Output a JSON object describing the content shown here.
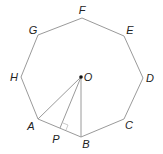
{
  "diagram": {
    "colors": {
      "line": "#9a9a9a",
      "text": "#222222",
      "point": "#111111"
    },
    "vertices": [
      {
        "name": "F",
        "x": 82,
        "y": 18,
        "lx": 82,
        "ly": 14
      },
      {
        "name": "E",
        "x": 124,
        "y": 36,
        "lx": 130,
        "ly": 34
      },
      {
        "name": "D",
        "x": 143,
        "y": 78,
        "lx": 150,
        "ly": 82
      },
      {
        "name": "C",
        "x": 124,
        "y": 119,
        "lx": 129,
        "ly": 129
      },
      {
        "name": "B",
        "x": 81,
        "y": 137,
        "lx": 86,
        "ly": 148
      },
      {
        "name": "A",
        "x": 38,
        "y": 119,
        "lx": 31,
        "ly": 130
      },
      {
        "name": "H",
        "x": 21,
        "y": 77,
        "lx": 14,
        "ly": 81
      },
      {
        "name": "G",
        "x": 38,
        "y": 35,
        "lx": 33,
        "ly": 34
      }
    ],
    "center": {
      "name": "O",
      "x": 81,
      "y": 77,
      "lx": 85,
      "ly": 81
    },
    "foot": {
      "name": "P",
      "x": 60,
      "y": 128,
      "lx": 54,
      "ly": 143
    },
    "segments": [
      "OA",
      "OB",
      "OP"
    ],
    "right_angle_at": "P"
  }
}
